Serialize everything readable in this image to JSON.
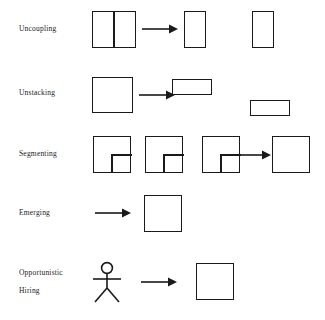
{
  "diagram": {
    "background_color": "#ffffff",
    "stroke_color": "#1a1a1a",
    "rows": [
      {
        "id": "uncoupling",
        "label": "Uncoupling",
        "label_line2": "",
        "description": "A square divided by a vertical line becomes two separate tall rectangles"
      },
      {
        "id": "unstacking",
        "label": "Unstacking",
        "label_line2": "",
        "description": "A square becomes two separate wide flat rectangles"
      },
      {
        "id": "segmenting",
        "label": "Segmenting",
        "label_line2": "",
        "description": "Three squares with notched lower-right sub-squares become one plain square"
      },
      {
        "id": "emerging",
        "label": "Emerging",
        "label_line2": "",
        "description": "An arrow from nothing produces a new square"
      },
      {
        "id": "opportunistic-hiring",
        "label": "Opportunistic",
        "label_line2": "Hiring",
        "description": "A stick figure person becomes a square organization"
      }
    ]
  }
}
